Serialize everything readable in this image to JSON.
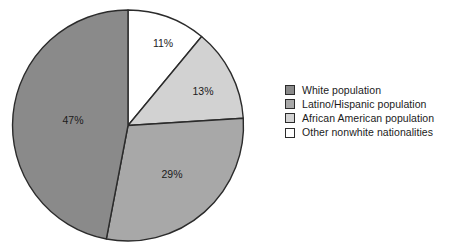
{
  "chart_data": {
    "type": "pie",
    "title": "",
    "subtitle": "",
    "xlabel": "",
    "ylabel": "",
    "grid": false,
    "legend_position": "right",
    "start_angle_deg": 0,
    "direction": "clockwise",
    "categories": [
      "White population",
      "Latino/Hispanic population",
      "African American population",
      "Other nonwhite nationalities"
    ],
    "values": [
      47,
      29,
      13,
      11
    ],
    "data_labels": [
      "47%",
      "29%",
      "13%",
      "11%"
    ],
    "colors": [
      "#8a8a8a",
      "#a8a8a8",
      "#d2d2d2",
      "#ffffff"
    ],
    "slice_order_clockwise_from_top": [
      {
        "label": "Other nonwhite nationalities",
        "value": 11,
        "data_label": "11%",
        "color": "#ffffff",
        "label_x": 163,
        "label_y": 44
      },
      {
        "label": "African American population",
        "value": 13,
        "data_label": "13%",
        "color": "#d2d2d2",
        "label_x": 203,
        "label_y": 92
      },
      {
        "label": "Latino/Hispanic population",
        "value": 29,
        "data_label": "29%",
        "color": "#a8a8a8",
        "label_x": 172,
        "label_y": 175
      },
      {
        "label": "White population",
        "value": 47,
        "data_label": "47%",
        "color": "#8a8a8a",
        "label_x": 73,
        "label_y": 121
      }
    ],
    "outline_color": "#2b2b2b"
  },
  "pie": {
    "center_x": 128,
    "center_y": 125.5,
    "radius": 115.5
  },
  "legend": {
    "items": [
      {
        "label": "White population",
        "color": "#8a8a8a"
      },
      {
        "label": "Latino/Hispanic population",
        "color": "#a8a8a8"
      },
      {
        "label": "African American population",
        "color": "#d2d2d2"
      },
      {
        "label": "Other nonwhite nationalities",
        "color": "#ffffff"
      }
    ]
  }
}
